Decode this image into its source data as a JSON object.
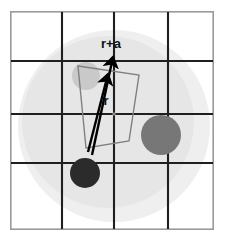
{
  "figure": {
    "width": 226,
    "height": 241,
    "background_color": "#ffffff"
  },
  "frame": {
    "name": "outer-frame",
    "x": 10,
    "y": 11,
    "width": 204,
    "height": 219,
    "stroke_color": "#9a9a9a",
    "stroke_width": 1.6,
    "fill_color": "#ffffff"
  },
  "blobs": [
    {
      "name": "outer-halo-circle",
      "cx": 114,
      "cy": 126,
      "r": 96,
      "fill_color": "#efefef"
    },
    {
      "name": "inner-shaded-circle",
      "cx": 108,
      "cy": 122,
      "r": 86,
      "fill_color": "#e6e6e6"
    }
  ],
  "grid": {
    "stroke_color": "#1f1f1f",
    "stroke_width": 2.1,
    "vertical_x": [
      62,
      114,
      168
    ],
    "horizontal_y": [
      61,
      114,
      163
    ],
    "extent": {
      "x0": 11,
      "x1": 213,
      "y0": 12,
      "y1": 229
    }
  },
  "polygon": {
    "name": "wedge-outline",
    "points": "78,66 139,75 129,141 86,148",
    "stroke_color": "#808080",
    "stroke_width": 1.4,
    "fill_color": "none"
  },
  "vectors": [
    {
      "name": "vector-r-plus-a",
      "label": "r+a",
      "x1": 92,
      "y1": 155,
      "x2": 113,
      "y2": 55,
      "stroke_color": "#000000",
      "stroke_width": 2.4,
      "label_x": 111,
      "label_y": 48
    },
    {
      "name": "vector-r",
      "label": "r",
      "x1": 88,
      "y1": 152,
      "x2": 108,
      "y2": 72,
      "stroke_color": "#000000",
      "stroke_width": 2.4,
      "label_x": 106,
      "label_y": 105
    }
  ],
  "particles": [
    {
      "name": "particle-light-gray",
      "cx": 86,
      "cy": 76,
      "r": 14,
      "fill_color": "#c9c9c9"
    },
    {
      "name": "particle-mid-gray",
      "cx": 161,
      "cy": 135,
      "r": 20,
      "fill_color": "#777777"
    },
    {
      "name": "particle-dark",
      "cx": 85,
      "cy": 173,
      "r": 15,
      "fill_color": "#2b2b2b"
    }
  ],
  "origin_marker": {
    "name": "origin-dot",
    "cx": 114,
    "cy": 114,
    "r": 1.8,
    "fill_color": "#888888"
  }
}
